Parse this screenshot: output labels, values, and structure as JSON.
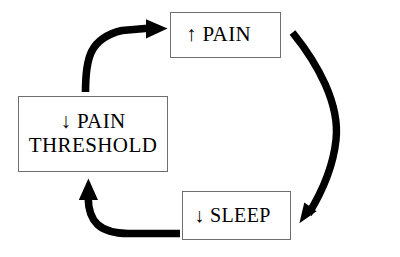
{
  "diagram": {
    "type": "cycle-flowchart",
    "canvas": {
      "width": 400,
      "height": 257,
      "background": "#ffffff"
    },
    "style": {
      "box_border_color": "#6e6e6e",
      "box_fill": "#ffffff",
      "text_color": "#000000",
      "arrow_color": "#000000"
    },
    "nodes": [
      {
        "id": "pain",
        "label": "↑ PAIN",
        "text_lines": [
          "↑ PAIN"
        ],
        "direction_marker": "↑",
        "concept": "PAIN",
        "x": 170,
        "y": 12,
        "width": 111,
        "height": 46
      },
      {
        "id": "pain_threshold",
        "label": "↓ PAIN\nTHRESHOLD",
        "text_lines": [
          "↓ PAIN",
          "THRESHOLD"
        ],
        "direction_marker": "↓",
        "concept": "PAIN THRESHOLD",
        "x": 18,
        "y": 96,
        "width": 150,
        "height": 76
      },
      {
        "id": "sleep",
        "label": "↓ SLEEP",
        "text_lines": [
          "↓ SLEEP"
        ],
        "direction_marker": "↓",
        "concept": "SLEEP",
        "x": 182,
        "y": 191,
        "width": 109,
        "height": 49
      }
    ],
    "edges": [
      {
        "id": "edge-threshold-to-pain",
        "from": "pain_threshold",
        "to": "pain",
        "shape": "curved-elbow-up-right",
        "label": ""
      },
      {
        "id": "edge-pain-to-sleep",
        "from": "pain",
        "to": "sleep",
        "shape": "s-curve-down-left",
        "label": ""
      },
      {
        "id": "edge-sleep-to-threshold",
        "from": "sleep",
        "to": "pain_threshold",
        "shape": "curved-elbow-left-up",
        "label": ""
      }
    ]
  }
}
